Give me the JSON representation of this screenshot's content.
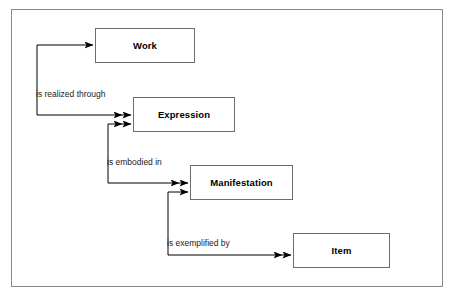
{
  "diagram": {
    "type": "entity-relationship",
    "background_color": "#ffffff",
    "border_color": "#8a8a8a",
    "line_color": "#000000",
    "box_border_color": "#6d6d6d",
    "text_color": "#000000",
    "entities": [
      {
        "id": "work",
        "label": "Work",
        "x": 95,
        "y": 28,
        "width": 100,
        "height": 35
      },
      {
        "id": "expression",
        "label": "Expression",
        "x": 133,
        "y": 97,
        "width": 102,
        "height": 35
      },
      {
        "id": "manifestation",
        "label": "Manifestation",
        "x": 190,
        "y": 165,
        "width": 103,
        "height": 35
      },
      {
        "id": "item",
        "label": "Item",
        "x": 293,
        "y": 233,
        "width": 97,
        "height": 35
      }
    ],
    "relationships": [
      {
        "id": "is-realized-through",
        "label": "is realized through",
        "from": "work",
        "to": "expression",
        "label_x": 36,
        "label_y": 89,
        "arrowhead": "double"
      },
      {
        "id": "is-embodied-in",
        "label": "is embodied in",
        "from": "expression",
        "to": "manifestation",
        "label_x": 107,
        "label_y": 157,
        "arrowhead": "double"
      },
      {
        "id": "is-exemplified-by",
        "label": "is exemplified by",
        "from": "manifestation",
        "to": "item",
        "label_x": 167,
        "label_y": 238,
        "arrowhead": "double"
      }
    ]
  }
}
